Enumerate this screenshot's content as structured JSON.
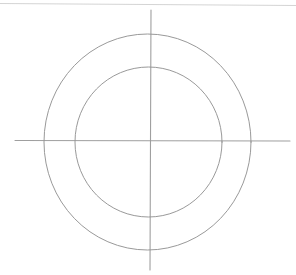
{
  "document": {
    "title": "Concentric Circles Sketch",
    "kind": "line-drawing",
    "canvas": {
      "width": 296,
      "height": 275,
      "background_color": "#ffffff"
    }
  },
  "palette": {
    "ink": "#8e8e8e",
    "ink_light": "#b4b4b4",
    "ink_faint": "#cdcdcd",
    "background": "#ffffff"
  },
  "figure": {
    "center": {
      "x": 147.5,
      "y": 141.5
    },
    "shapes": [
      {
        "id": "top-edge-line",
        "name": "top-border-line",
        "type": "line",
        "x1": 0,
        "y1": 3.5,
        "x2": 296,
        "y2": 5.5,
        "color": "#cdcdcd",
        "width": 1.1,
        "opacity": 0.85
      },
      {
        "id": "vertical-axis",
        "name": "vertical-axis-line",
        "type": "line",
        "x1": 151,
        "y1": 10,
        "x2": 150,
        "y2": 270,
        "color": "#9a9a9a",
        "width": 1.1,
        "opacity": 0.95
      },
      {
        "id": "horizontal-axis",
        "name": "horizontal-axis-line",
        "type": "line",
        "x1": 15,
        "y1": 140.5,
        "x2": 290,
        "y2": 141,
        "color": "#9a9a9a",
        "width": 1.1,
        "opacity": 0.95
      },
      {
        "id": "outer-circle",
        "name": "outer-circle",
        "type": "ellipse",
        "cx": 147.5,
        "cy": 142,
        "rx": 103.5,
        "ry": 108,
        "color": "#949494",
        "width": 1.0,
        "opacity": 0.95
      },
      {
        "id": "inner-circle",
        "name": "inner-circle",
        "type": "ellipse",
        "cx": 148.5,
        "cy": 142,
        "rx": 73.5,
        "ry": 75,
        "color": "#949494",
        "width": 1.0,
        "opacity": 0.95
      }
    ]
  }
}
